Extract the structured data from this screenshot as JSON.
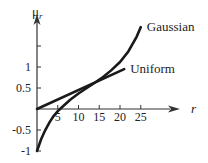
{
  "chart_data": {
    "type": "line",
    "title": "",
    "xlabel": "r",
    "ylabel": "μr",
    "ylabel_main": "μ",
    "ylabel_sub": "r",
    "xlim": [
      0,
      30
    ],
    "ylim": [
      -1,
      2.2
    ],
    "grid": false,
    "x_ticks": [
      5,
      10,
      15,
      20,
      25
    ],
    "x_tick_labels": [
      "5",
      "10",
      "15",
      "20",
      "25"
    ],
    "y_ticks": [
      1.5,
      1,
      0.5,
      -0.5,
      -1
    ],
    "y_tick_labels": [
      "",
      "1",
      "0.5",
      "-0.5",
      "-1"
    ],
    "legend": "inline-right",
    "series": [
      {
        "name": "Gaussian",
        "x": [
          0,
          1,
          2,
          3,
          4,
          5,
          6,
          8,
          10,
          12,
          14,
          16,
          18,
          20,
          22,
          24,
          25
        ],
        "values": [
          -1,
          -0.72,
          -0.5,
          -0.32,
          -0.17,
          -0.05,
          0.04,
          0.22,
          0.37,
          0.5,
          0.63,
          0.77,
          0.93,
          1.12,
          1.37,
          1.72,
          1.95
        ]
      },
      {
        "name": "Uniform",
        "x": [
          0,
          21
        ],
        "values": [
          0,
          0.95
        ]
      }
    ]
  }
}
